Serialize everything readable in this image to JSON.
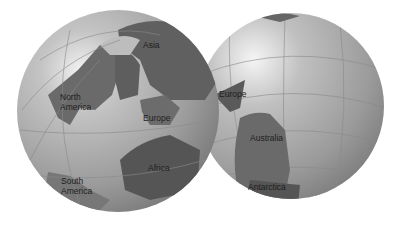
{
  "figure": {
    "left_globe": {
      "labels": {
        "asia": "Asia",
        "north_america_1": "North",
        "north_america_2": "America",
        "europe": "Europe",
        "africa": "Africa",
        "south_america_1": "South",
        "south_america_2": "America"
      }
    },
    "right_globe": {
      "labels": {
        "europe": "Europe",
        "australia": "Australia",
        "antarctica": "Antarctica"
      }
    },
    "colors": {
      "ocean_light": "#d9d9d9",
      "ocean_mid": "#a8a8a8",
      "ocean_dark": "#7a7a7a",
      "land": "#6e6e6e",
      "land_dark": "#4f4f4f",
      "shelf": "#8f8f8f"
    }
  }
}
